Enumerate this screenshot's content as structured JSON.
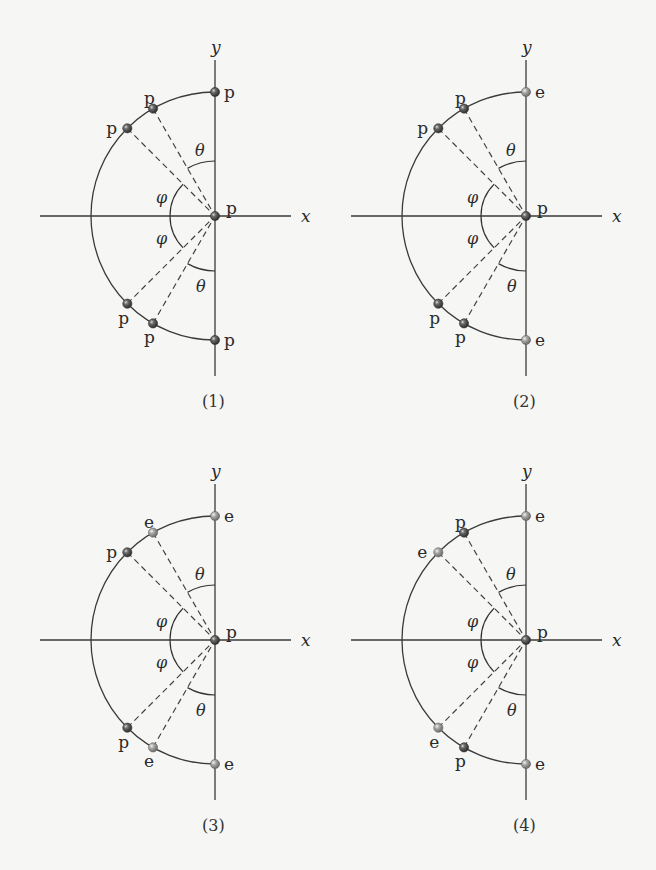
{
  "figure": {
    "axis_labels": {
      "x": "x",
      "y": "y"
    },
    "angle_labels": {
      "theta": "θ",
      "phi": "φ"
    },
    "geometry": {
      "radius": 124,
      "theta_deg": 30,
      "phi_deg": 45,
      "theta_arc_radius": 55,
      "phi_arc_radius": 45
    },
    "colors": {
      "p_particle": "#4f4f4f",
      "e_particle": "#a3a3a3",
      "line": "#3a3a3a",
      "background": "#f6f6f4"
    },
    "panels": [
      {
        "caption": "(1)",
        "origin": [
          215,
          216
        ],
        "points": {
          "top_y": "p",
          "upper_theta": "p",
          "upper_phi": "p",
          "origin": "p",
          "lower_phi": "p",
          "lower_theta": "p",
          "bottom_y": "p"
        }
      },
      {
        "caption": "(2)",
        "origin": [
          526,
          216
        ],
        "points": {
          "top_y": "e",
          "upper_theta": "p",
          "upper_phi": "p",
          "origin": "p",
          "lower_phi": "p",
          "lower_theta": "p",
          "bottom_y": "e"
        }
      },
      {
        "caption": "(3)",
        "origin": [
          215,
          640
        ],
        "points": {
          "top_y": "e",
          "upper_theta": "e",
          "upper_phi": "p",
          "origin": "p",
          "lower_phi": "p",
          "lower_theta": "e",
          "bottom_y": "e"
        }
      },
      {
        "caption": "(4)",
        "origin": [
          526,
          640
        ],
        "points": {
          "top_y": "e",
          "upper_theta": "p",
          "upper_phi": "e",
          "origin": "p",
          "lower_phi": "e",
          "lower_theta": "p",
          "bottom_y": "e"
        }
      }
    ]
  }
}
